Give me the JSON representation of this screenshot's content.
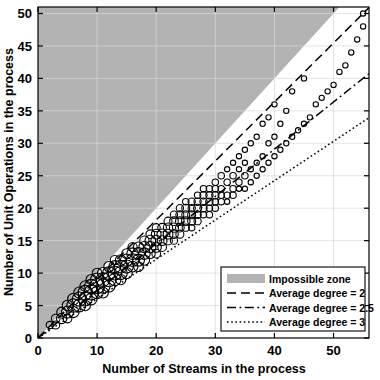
{
  "chart_data": {
    "type": "scatter",
    "title": "",
    "xlabel": "Number of Streams in the process",
    "ylabel": "Number of Unit Operations in the process",
    "xlim": [
      0,
      56
    ],
    "ylim": [
      0,
      51
    ],
    "xticks": [
      0,
      10,
      20,
      30,
      40,
      50
    ],
    "yticks": [
      0,
      5,
      10,
      15,
      20,
      25,
      30,
      35,
      40,
      45,
      50
    ],
    "grid": true,
    "grid_color": "#d9d9d9",
    "legend_position": "lower-right",
    "marker": "open-circle",
    "marker_note": "Marker area scales with number of coincident processes at that (streams, unit operations) pair",
    "shaded_region": {
      "name": "Impossible zone",
      "color": "#b3b3b3",
      "description": "Region above the line y = x (more unit operations than streams)",
      "boundary_slope": 1.0
    },
    "reference_lines": [
      {
        "name": "Average degree = 2",
        "style": "dashed",
        "slope": 0.9091,
        "intercept": 0,
        "color": "#000000"
      },
      {
        "name": "Average degree = 2.5",
        "style": "dash-dot",
        "slope": 0.7273,
        "intercept": 0,
        "color": "#000000"
      },
      {
        "name": "Average degree = 3",
        "style": "dotted",
        "slope": 0.6061,
        "intercept": 0,
        "color": "#000000"
      }
    ],
    "points": [
      {
        "x": 2,
        "y": 2,
        "n": 3
      },
      {
        "x": 3,
        "y": 2,
        "n": 4
      },
      {
        "x": 3,
        "y": 3,
        "n": 5
      },
      {
        "x": 4,
        "y": 3,
        "n": 8
      },
      {
        "x": 4,
        "y": 4,
        "n": 7
      },
      {
        "x": 5,
        "y": 3,
        "n": 5
      },
      {
        "x": 5,
        "y": 4,
        "n": 12
      },
      {
        "x": 5,
        "y": 5,
        "n": 9
      },
      {
        "x": 6,
        "y": 4,
        "n": 10
      },
      {
        "x": 6,
        "y": 5,
        "n": 16
      },
      {
        "x": 6,
        "y": 6,
        "n": 11
      },
      {
        "x": 7,
        "y": 5,
        "n": 14
      },
      {
        "x": 7,
        "y": 6,
        "n": 18
      },
      {
        "x": 7,
        "y": 7,
        "n": 10
      },
      {
        "x": 8,
        "y": 5,
        "n": 8
      },
      {
        "x": 8,
        "y": 6,
        "n": 17
      },
      {
        "x": 8,
        "y": 7,
        "n": 19
      },
      {
        "x": 8,
        "y": 8,
        "n": 9
      },
      {
        "x": 9,
        "y": 6,
        "n": 11
      },
      {
        "x": 9,
        "y": 7,
        "n": 20
      },
      {
        "x": 9,
        "y": 8,
        "n": 16
      },
      {
        "x": 9,
        "y": 9,
        "n": 8
      },
      {
        "x": 10,
        "y": 7,
        "n": 13
      },
      {
        "x": 10,
        "y": 8,
        "n": 21
      },
      {
        "x": 10,
        "y": 9,
        "n": 15
      },
      {
        "x": 10,
        "y": 10,
        "n": 7
      },
      {
        "x": 11,
        "y": 7,
        "n": 9
      },
      {
        "x": 11,
        "y": 8,
        "n": 18
      },
      {
        "x": 11,
        "y": 9,
        "n": 17
      },
      {
        "x": 11,
        "y": 10,
        "n": 10
      },
      {
        "x": 12,
        "y": 8,
        "n": 12
      },
      {
        "x": 12,
        "y": 9,
        "n": 19
      },
      {
        "x": 12,
        "y": 10,
        "n": 14
      },
      {
        "x": 12,
        "y": 11,
        "n": 8
      },
      {
        "x": 13,
        "y": 9,
        "n": 13
      },
      {
        "x": 13,
        "y": 10,
        "n": 17
      },
      {
        "x": 13,
        "y": 11,
        "n": 12
      },
      {
        "x": 13,
        "y": 12,
        "n": 6
      },
      {
        "x": 14,
        "y": 9,
        "n": 8
      },
      {
        "x": 14,
        "y": 10,
        "n": 15
      },
      {
        "x": 14,
        "y": 11,
        "n": 14
      },
      {
        "x": 14,
        "y": 12,
        "n": 9
      },
      {
        "x": 15,
        "y": 10,
        "n": 10
      },
      {
        "x": 15,
        "y": 11,
        "n": 15
      },
      {
        "x": 15,
        "y": 12,
        "n": 13
      },
      {
        "x": 15,
        "y": 13,
        "n": 7
      },
      {
        "x": 16,
        "y": 11,
        "n": 9
      },
      {
        "x": 16,
        "y": 12,
        "n": 14
      },
      {
        "x": 16,
        "y": 13,
        "n": 11
      },
      {
        "x": 16,
        "y": 14,
        "n": 6
      },
      {
        "x": 17,
        "y": 11,
        "n": 7
      },
      {
        "x": 17,
        "y": 12,
        "n": 12
      },
      {
        "x": 17,
        "y": 13,
        "n": 12
      },
      {
        "x": 17,
        "y": 14,
        "n": 8
      },
      {
        "x": 18,
        "y": 12,
        "n": 8
      },
      {
        "x": 18,
        "y": 13,
        "n": 11
      },
      {
        "x": 18,
        "y": 14,
        "n": 10
      },
      {
        "x": 18,
        "y": 15,
        "n": 6
      },
      {
        "x": 19,
        "y": 13,
        "n": 7
      },
      {
        "x": 19,
        "y": 14,
        "n": 10
      },
      {
        "x": 19,
        "y": 15,
        "n": 9
      },
      {
        "x": 19,
        "y": 16,
        "n": 5
      },
      {
        "x": 20,
        "y": 13,
        "n": 5
      },
      {
        "x": 20,
        "y": 14,
        "n": 8
      },
      {
        "x": 20,
        "y": 15,
        "n": 9
      },
      {
        "x": 20,
        "y": 16,
        "n": 7
      },
      {
        "x": 20,
        "y": 17,
        "n": 4
      },
      {
        "x": 21,
        "y": 14,
        "n": 5
      },
      {
        "x": 21,
        "y": 15,
        "n": 7
      },
      {
        "x": 21,
        "y": 16,
        "n": 8
      },
      {
        "x": 21,
        "y": 17,
        "n": 5
      },
      {
        "x": 22,
        "y": 15,
        "n": 5
      },
      {
        "x": 22,
        "y": 16,
        "n": 7
      },
      {
        "x": 22,
        "y": 17,
        "n": 6
      },
      {
        "x": 22,
        "y": 18,
        "n": 4
      },
      {
        "x": 23,
        "y": 15,
        "n": 3
      },
      {
        "x": 23,
        "y": 16,
        "n": 5
      },
      {
        "x": 23,
        "y": 17,
        "n": 6
      },
      {
        "x": 23,
        "y": 18,
        "n": 5
      },
      {
        "x": 23,
        "y": 19,
        "n": 3
      },
      {
        "x": 24,
        "y": 16,
        "n": 4
      },
      {
        "x": 24,
        "y": 17,
        "n": 5
      },
      {
        "x": 24,
        "y": 18,
        "n": 5
      },
      {
        "x": 24,
        "y": 19,
        "n": 4
      },
      {
        "x": 24,
        "y": 20,
        "n": 3
      },
      {
        "x": 25,
        "y": 17,
        "n": 3
      },
      {
        "x": 25,
        "y": 18,
        "n": 5
      },
      {
        "x": 25,
        "y": 19,
        "n": 4
      },
      {
        "x": 25,
        "y": 20,
        "n": 4
      },
      {
        "x": 25,
        "y": 21,
        "n": 2
      },
      {
        "x": 26,
        "y": 17,
        "n": 2
      },
      {
        "x": 26,
        "y": 18,
        "n": 4
      },
      {
        "x": 26,
        "y": 19,
        "n": 4
      },
      {
        "x": 26,
        "y": 20,
        "n": 3
      },
      {
        "x": 26,
        "y": 21,
        "n": 3
      },
      {
        "x": 27,
        "y": 18,
        "n": 3
      },
      {
        "x": 27,
        "y": 19,
        "n": 3
      },
      {
        "x": 27,
        "y": 20,
        "n": 4
      },
      {
        "x": 27,
        "y": 21,
        "n": 3
      },
      {
        "x": 27,
        "y": 22,
        "n": 2
      },
      {
        "x": 28,
        "y": 19,
        "n": 2
      },
      {
        "x": 28,
        "y": 20,
        "n": 3
      },
      {
        "x": 28,
        "y": 21,
        "n": 3
      },
      {
        "x": 28,
        "y": 22,
        "n": 3
      },
      {
        "x": 28,
        "y": 23,
        "n": 2
      },
      {
        "x": 29,
        "y": 19,
        "n": 2
      },
      {
        "x": 29,
        "y": 20,
        "n": 2
      },
      {
        "x": 29,
        "y": 21,
        "n": 3
      },
      {
        "x": 29,
        "y": 22,
        "n": 3
      },
      {
        "x": 29,
        "y": 23,
        "n": 2
      },
      {
        "x": 30,
        "y": 20,
        "n": 2
      },
      {
        "x": 30,
        "y": 21,
        "n": 2
      },
      {
        "x": 30,
        "y": 22,
        "n": 3
      },
      {
        "x": 30,
        "y": 23,
        "n": 2
      },
      {
        "x": 30,
        "y": 24,
        "n": 2
      },
      {
        "x": 31,
        "y": 21,
        "n": 2
      },
      {
        "x": 31,
        "y": 22,
        "n": 2
      },
      {
        "x": 31,
        "y": 23,
        "n": 2
      },
      {
        "x": 31,
        "y": 25,
        "n": 2
      },
      {
        "x": 32,
        "y": 21,
        "n": 1
      },
      {
        "x": 32,
        "y": 22,
        "n": 2
      },
      {
        "x": 32,
        "y": 24,
        "n": 2
      },
      {
        "x": 32,
        "y": 26,
        "n": 1
      },
      {
        "x": 33,
        "y": 22,
        "n": 2
      },
      {
        "x": 33,
        "y": 23,
        "n": 2
      },
      {
        "x": 33,
        "y": 25,
        "n": 2
      },
      {
        "x": 33,
        "y": 27,
        "n": 1
      },
      {
        "x": 34,
        "y": 23,
        "n": 1
      },
      {
        "x": 34,
        "y": 24,
        "n": 2
      },
      {
        "x": 34,
        "y": 26,
        "n": 1
      },
      {
        "x": 34,
        "y": 28,
        "n": 1
      },
      {
        "x": 35,
        "y": 23,
        "n": 1
      },
      {
        "x": 35,
        "y": 25,
        "n": 2
      },
      {
        "x": 35,
        "y": 27,
        "n": 1
      },
      {
        "x": 35,
        "y": 29,
        "n": 1
      },
      {
        "x": 36,
        "y": 24,
        "n": 1
      },
      {
        "x": 36,
        "y": 26,
        "n": 1
      },
      {
        "x": 36,
        "y": 30,
        "n": 1
      },
      {
        "x": 37,
        "y": 25,
        "n": 1
      },
      {
        "x": 37,
        "y": 27,
        "n": 1
      },
      {
        "x": 37,
        "y": 31,
        "n": 1
      },
      {
        "x": 38,
        "y": 26,
        "n": 1
      },
      {
        "x": 38,
        "y": 28,
        "n": 1
      },
      {
        "x": 38,
        "y": 33,
        "n": 1
      },
      {
        "x": 39,
        "y": 27,
        "n": 1
      },
      {
        "x": 39,
        "y": 30,
        "n": 1
      },
      {
        "x": 39,
        "y": 34,
        "n": 1
      },
      {
        "x": 40,
        "y": 28,
        "n": 1
      },
      {
        "x": 40,
        "y": 31,
        "n": 1
      },
      {
        "x": 40,
        "y": 36,
        "n": 1
      },
      {
        "x": 41,
        "y": 29,
        "n": 1
      },
      {
        "x": 41,
        "y": 33,
        "n": 1
      },
      {
        "x": 42,
        "y": 30,
        "n": 1
      },
      {
        "x": 42,
        "y": 35,
        "n": 1
      },
      {
        "x": 43,
        "y": 31,
        "n": 1
      },
      {
        "x": 43,
        "y": 38,
        "n": 1
      },
      {
        "x": 44,
        "y": 32,
        "n": 1
      },
      {
        "x": 45,
        "y": 33,
        "n": 1
      },
      {
        "x": 45,
        "y": 40,
        "n": 1
      },
      {
        "x": 46,
        "y": 34,
        "n": 1
      },
      {
        "x": 47,
        "y": 36,
        "n": 1
      },
      {
        "x": 48,
        "y": 37,
        "n": 1
      },
      {
        "x": 49,
        "y": 38,
        "n": 1
      },
      {
        "x": 50,
        "y": 39,
        "n": 1
      },
      {
        "x": 51,
        "y": 41,
        "n": 1
      },
      {
        "x": 52,
        "y": 42,
        "n": 1
      },
      {
        "x": 53,
        "y": 44,
        "n": 1
      },
      {
        "x": 54,
        "y": 46,
        "n": 1
      },
      {
        "x": 55,
        "y": 48,
        "n": 1
      },
      {
        "x": 55,
        "y": 50,
        "n": 1
      }
    ]
  },
  "legend": {
    "entries": [
      {
        "label": "Impossible zone",
        "style": "patch"
      },
      {
        "label": "Average degree = 2",
        "style": "dashed"
      },
      {
        "label": "Average degree = 2.5",
        "style": "dash-dot"
      },
      {
        "label": "Average degree = 3",
        "style": "dotted"
      }
    ]
  }
}
